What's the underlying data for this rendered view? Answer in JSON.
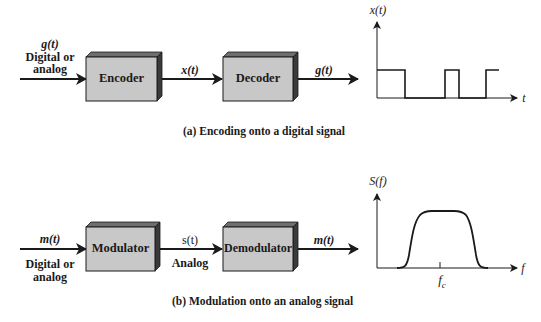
{
  "colors": {
    "box_face": "#c8c8c8",
    "box_top": "#6e6e6e",
    "box_side": "#3a3a3a",
    "line": "#1a1a1a",
    "background": "#ffffff"
  },
  "panel_a": {
    "input_signal": "g(t)",
    "input_desc_line1": "Digital or",
    "input_desc_line2": "analog",
    "block1": "Encoder",
    "mid_signal": "x(t)",
    "block2": "Decoder",
    "output_signal": "g(t)",
    "plot_ylabel": "x(t)",
    "plot_xlabel": "t",
    "caption": "(a) Encoding onto a digital signal"
  },
  "panel_b": {
    "input_signal": "m(t)",
    "input_desc_line1": "Digital or",
    "input_desc_line2": "analog",
    "block1": "Modulator",
    "mid_signal": "s(t)",
    "mid_desc": "Analog",
    "block2": "Demodulator",
    "output_signal": "m(t)",
    "plot_ylabel": "S(f)",
    "plot_xlabel": "f",
    "plot_tick_label": "f",
    "plot_tick_sub": "c",
    "caption": "(b) Modulation onto an analog signal"
  }
}
